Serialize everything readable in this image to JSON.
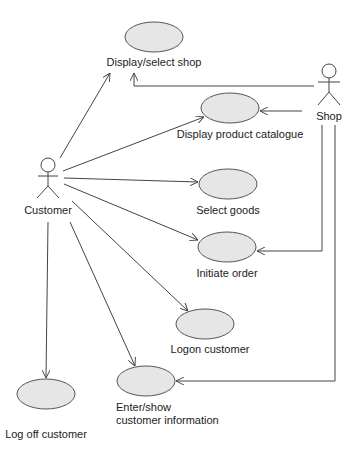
{
  "diagram": {
    "type": "uml-use-case",
    "actors": [
      {
        "id": "customer",
        "label": "Customer"
      },
      {
        "id": "shop",
        "label": "Shop"
      }
    ],
    "use_cases": [
      {
        "id": "uc1",
        "label": "Display/select shop"
      },
      {
        "id": "uc2",
        "label": "Display product catalogue"
      },
      {
        "id": "uc3",
        "label": "Select goods"
      },
      {
        "id": "uc4",
        "label": "Initiate order"
      },
      {
        "id": "uc5",
        "label": "Logon customer"
      },
      {
        "id": "uc6",
        "label_line1": "Enter/show",
        "label_line2": "customer information"
      },
      {
        "id": "uc7",
        "label": "Log off customer"
      }
    ],
    "associations": [
      {
        "from": "customer",
        "to": "uc1"
      },
      {
        "from": "customer",
        "to": "uc2"
      },
      {
        "from": "customer",
        "to": "uc3"
      },
      {
        "from": "customer",
        "to": "uc4"
      },
      {
        "from": "customer",
        "to": "uc5"
      },
      {
        "from": "customer",
        "to": "uc6"
      },
      {
        "from": "customer",
        "to": "uc7"
      },
      {
        "from": "shop",
        "to": "uc1"
      },
      {
        "from": "shop",
        "to": "uc2"
      },
      {
        "from": "shop",
        "to": "uc4"
      },
      {
        "from": "shop",
        "to": "uc6"
      }
    ],
    "colors": {
      "ellipse_fill": "#e6e6e6",
      "stroke": "#444444",
      "text": "#222222"
    }
  }
}
